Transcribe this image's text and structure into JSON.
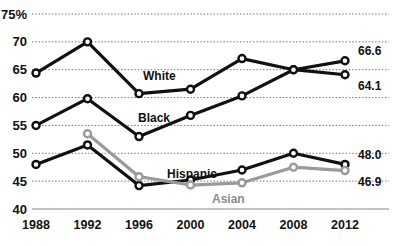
{
  "chart_data": {
    "type": "line",
    "title": "",
    "xlabel": "",
    "ylabel": "",
    "grid": true,
    "legend": "inline-labels",
    "x": [
      1988,
      1992,
      1996,
      2000,
      2004,
      2008,
      2012
    ],
    "categories": [
      "1988",
      "1992",
      "1996",
      "2000",
      "2004",
      "2008",
      "2012"
    ],
    "ylim": [
      40,
      75
    ],
    "yticks": [
      40,
      45,
      50,
      55,
      60,
      65,
      70,
      75
    ],
    "ytick_labels": [
      "40",
      "45",
      "50",
      "55",
      "60",
      "65",
      "70",
      "75%"
    ],
    "series": [
      {
        "name": "White",
        "color": "#111111",
        "values": [
          64.4,
          70.0,
          60.7,
          61.5,
          67.0,
          65.0,
          64.1
        ],
        "end_label": "64.1"
      },
      {
        "name": "Black",
        "color": "#111111",
        "values": [
          55.0,
          59.8,
          53.0,
          56.8,
          60.3,
          65.0,
          66.6
        ],
        "end_label": "66.6"
      },
      {
        "name": "Hispanic",
        "color": "#111111",
        "values": [
          48.0,
          51.5,
          44.2,
          45.2,
          47.0,
          50.0,
          48.0
        ],
        "end_label": "48.0"
      },
      {
        "name": "Asian",
        "color": "#9a9a9a",
        "values": [
          null,
          53.5,
          45.8,
          44.3,
          44.7,
          47.5,
          46.9
        ],
        "end_label": "46.9"
      }
    ],
    "inline_labels": [
      {
        "text": "White",
        "series": "White"
      },
      {
        "text": "Black",
        "series": "Black"
      },
      {
        "text": "Hispanic",
        "series": "Hispanic"
      },
      {
        "text": "Asian",
        "series": "Asian"
      }
    ]
  }
}
